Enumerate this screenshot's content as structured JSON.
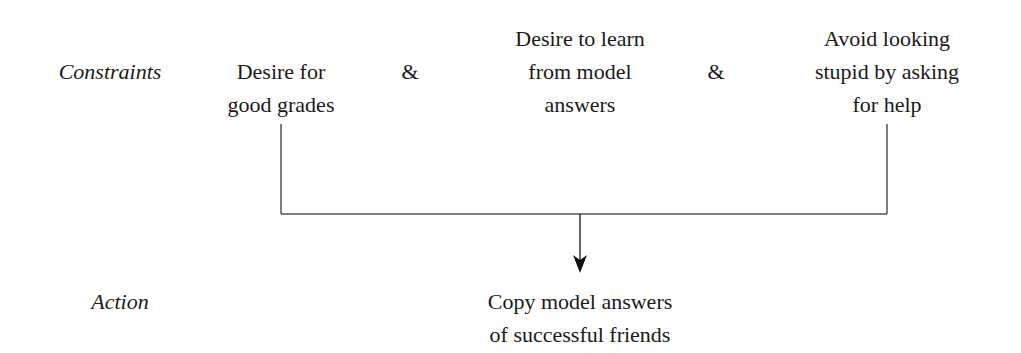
{
  "diagram": {
    "row_labels": {
      "constraints": "Constraints",
      "action": "Action"
    },
    "constraints": [
      {
        "lines": [
          "Desire for",
          "good grades"
        ]
      },
      {
        "lines": [
          "Desire to learn",
          "from model",
          "answers"
        ]
      },
      {
        "lines": [
          "Avoid looking",
          "stupid by asking",
          "for help"
        ]
      }
    ],
    "connectors": [
      "&",
      "&"
    ],
    "action": {
      "lines": [
        "Copy model answers",
        "of successful friends"
      ]
    }
  }
}
